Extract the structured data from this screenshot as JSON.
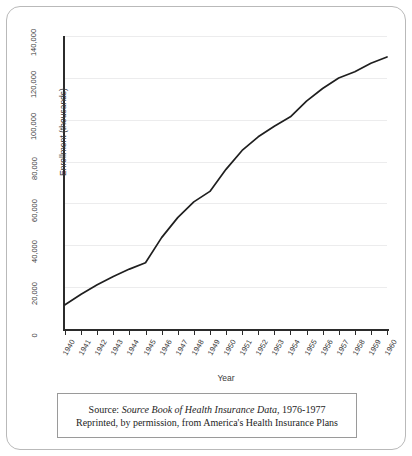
{
  "figure": {
    "background_color": "#ffffff",
    "frame_color": "#b9b9b9",
    "line_color": "#1f1f1f",
    "grid_color": "#ececed",
    "axis_color": "#2b2b2b"
  },
  "caption": {
    "line1_prefix": "Source: ",
    "line1_italic": "Source Book of Health Insurance Data",
    "line1_suffix": ", 1976-1977",
    "line2": "Reprinted, by permission, from America's Health Insurance Plans"
  },
  "chart_data": {
    "type": "line",
    "title": "",
    "xlabel": "Year",
    "ylabel": "Enrollment (thousands)",
    "x": [
      1940,
      1941,
      1942,
      1943,
      1944,
      1945,
      1946,
      1947,
      1948,
      1949,
      1950,
      1951,
      1952,
      1953,
      1954,
      1955,
      1956,
      1957,
      1958,
      1959,
      1960
    ],
    "categories": [
      "1940",
      "1941",
      "1942",
      "1943",
      "1944",
      "1945",
      "1946",
      "1947",
      "1948",
      "1949",
      "1950",
      "1951",
      "1952",
      "1953",
      "1954",
      "1955",
      "1956",
      "1957",
      "1958",
      "1959",
      "1960"
    ],
    "values": [
      12000,
      17000,
      21500,
      25500,
      29000,
      32000,
      44000,
      53500,
      61000,
      66000,
      76500,
      85500,
      92000,
      97000,
      101500,
      109000,
      115000,
      120000,
      123000,
      127000,
      130000
    ],
    "series": [
      {
        "name": "Enrollment",
        "values": [
          12000,
          17000,
          21500,
          25500,
          29000,
          32000,
          44000,
          53500,
          61000,
          66000,
          76500,
          85500,
          92000,
          97000,
          101500,
          109000,
          115000,
          120000,
          123000,
          127000,
          130000
        ]
      }
    ],
    "ylim": [
      0,
      140000
    ],
    "xlim": [
      1940,
      1960
    ],
    "yticks": [
      0,
      20000,
      40000,
      60000,
      80000,
      100000,
      120000,
      140000
    ],
    "ytick_labels": [
      "0",
      "20,000",
      "40,000",
      "60,000",
      "80,000",
      "100,000",
      "120,000",
      "140,000"
    ],
    "grid": "horizontal",
    "legend": "none",
    "annotations": []
  }
}
